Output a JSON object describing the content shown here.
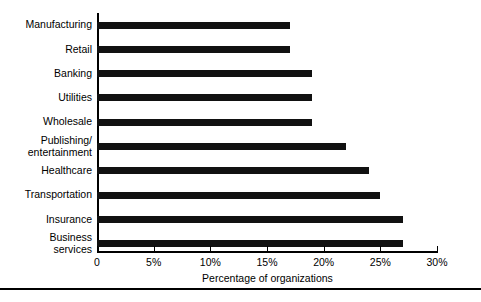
{
  "chart_data": {
    "type": "bar",
    "orientation": "horizontal",
    "title": "",
    "xlabel": "Percentage of organizations",
    "ylabel": "",
    "xlim": [
      0,
      30
    ],
    "ylim": null,
    "grid": false,
    "legend": null,
    "bar_color": "#111111",
    "background_color": "#ffffff",
    "xticks": [
      0,
      5,
      10,
      15,
      20,
      25,
      30
    ],
    "xtick_labels": [
      "0",
      "5%",
      "10%",
      "15%",
      "20%",
      "25%",
      "30%"
    ],
    "categories": [
      "Manufacturing",
      "Retail",
      "Banking",
      "Utilities",
      "Wholesale",
      "Publishing/\nentertainment",
      "Healthcare",
      "Transportation",
      "Insurance",
      "Business\nservices"
    ],
    "values": [
      17,
      17,
      19,
      19,
      19,
      22,
      24,
      25,
      27,
      27
    ],
    "units": "percent"
  },
  "footer": {
    "rule": true
  }
}
